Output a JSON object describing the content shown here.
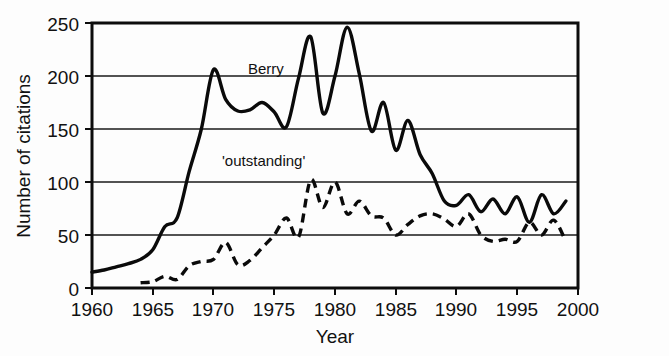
{
  "chart_data": {
    "type": "line",
    "title": "",
    "xlabel": "Year",
    "ylabel": "Number of citations",
    "xlim": [
      1960,
      2000
    ],
    "ylim": [
      0,
      250
    ],
    "xticks": [
      1960,
      1965,
      1970,
      1975,
      1980,
      1985,
      1990,
      1995,
      2000
    ],
    "xtick_labels": [
      "1960",
      "1965",
      "1970",
      "1975",
      "1980",
      "1985",
      "1990",
      "1995",
      "2000"
    ],
    "yticks": [
      0,
      50,
      100,
      150,
      200,
      250
    ],
    "ytick_labels": [
      "0",
      "50",
      "100",
      "150",
      "200",
      "250"
    ],
    "grid": "horizontal",
    "legend_position": "inline-annotations",
    "annotations": [
      {
        "text": "Berry",
        "x": 1976.2,
        "y": 213,
        "series": "Berry"
      },
      {
        "text": "'outstanding'",
        "x": 1972.5,
        "y": 139,
        "series": "'outstanding'"
      }
    ],
    "series": [
      {
        "name": "Berry",
        "style": "solid",
        "x": [
          1960,
          1961,
          1962,
          1963,
          1964,
          1965,
          1966,
          1967,
          1968,
          1969,
          1970,
          1971,
          1972,
          1973,
          1974,
          1975,
          1976,
          1977,
          1978,
          1979,
          1980,
          1981,
          1982,
          1983,
          1984,
          1985,
          1986,
          1987,
          1988,
          1989,
          1990,
          1991,
          1992,
          1993,
          1994,
          1995,
          1996,
          1997,
          1998,
          1999
        ],
        "values": [
          15,
          17,
          20,
          23,
          27,
          36,
          58,
          66,
          110,
          150,
          206,
          178,
          167,
          168,
          175,
          166,
          152,
          198,
          237,
          165,
          200,
          246,
          202,
          148,
          175,
          130,
          158,
          126,
          108,
          82,
          78,
          88,
          72,
          84,
          70,
          86,
          62,
          88,
          70,
          82
        ]
      },
      {
        "name": "'outstanding'",
        "style": "dashed",
        "x": [
          1964,
          1965,
          1966,
          1967,
          1968,
          1969,
          1970,
          1971,
          1972,
          1973,
          1974,
          1975,
          1976,
          1977,
          1978,
          1979,
          1980,
          1981,
          1982,
          1983,
          1984,
          1985,
          1986,
          1987,
          1988,
          1989,
          1990,
          1991,
          1992,
          1993,
          1994,
          1995,
          1996,
          1997,
          1998,
          1999
        ],
        "values": [
          5,
          6,
          11,
          8,
          21,
          25,
          27,
          43,
          22,
          26,
          38,
          50,
          66,
          48,
          102,
          76,
          100,
          70,
          82,
          68,
          66,
          50,
          60,
          68,
          70,
          65,
          58,
          70,
          50,
          44,
          46,
          44,
          62,
          50,
          64,
          44
        ]
      }
    ]
  }
}
